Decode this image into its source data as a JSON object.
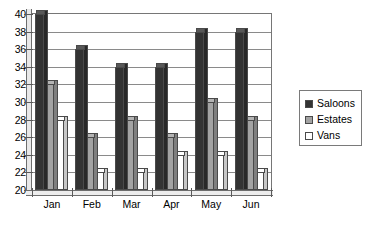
{
  "chart_data": {
    "type": "bar",
    "title": "",
    "subtitle": "",
    "xlabel": "",
    "ylabel": "",
    "categories": [
      "Jan",
      "Feb",
      "Mar",
      "Apr",
      "May",
      "Jun"
    ],
    "series": [
      {
        "name": "Saloons",
        "color": "#333333",
        "values": [
          40,
          36,
          34,
          34,
          38,
          38
        ]
      },
      {
        "name": "Estates",
        "color": "#a3a3a3",
        "values": [
          32,
          26,
          28,
          26,
          30,
          28
        ]
      },
      {
        "name": "Vans",
        "color": "#ffffff",
        "values": [
          28,
          22,
          22,
          24,
          24,
          22
        ]
      }
    ],
    "ylim": [
      20,
      40
    ],
    "ytick_step": 2,
    "yticks": [
      20,
      22,
      24,
      26,
      28,
      30,
      32,
      34,
      36,
      38,
      40
    ],
    "ytick_labels": [
      "20",
      "22",
      "24",
      "26",
      "28",
      "30",
      "32",
      "34",
      "36",
      "38",
      "40"
    ],
    "grid": true,
    "grid_axis": "y",
    "legend_position": "right",
    "legend_entries": [
      "Saloons",
      "Estates",
      "Vans"
    ],
    "style": "3d-column",
    "annotations": []
  },
  "legend": {
    "items": [
      {
        "label": "Saloons",
        "swatch": "#333333"
      },
      {
        "label": "Estates",
        "swatch": "#a3a3a3"
      },
      {
        "label": "Vans",
        "swatch": "#ffffff"
      }
    ]
  }
}
